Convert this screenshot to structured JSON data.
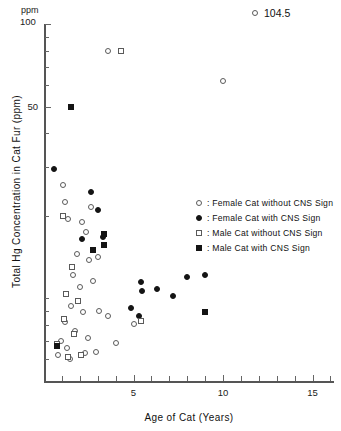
{
  "chart_data": {
    "type": "scatter",
    "title": "",
    "xlabel": "Age of Cat  (Years)",
    "ylabel": "Total Hg Concentration in Cat Fur  (ppm)",
    "yunit": "ppm",
    "yscale": "log",
    "xscale": "linear",
    "xlim": [
      0,
      16.2
    ],
    "ylim": [
      5,
      100
    ],
    "xticks": [
      5,
      10,
      15
    ],
    "xticklabels": [
      "5",
      "10",
      "15"
    ],
    "xminorticks": [
      1,
      2,
      3,
      4,
      6,
      7,
      8,
      9,
      11,
      12,
      13,
      14,
      16
    ],
    "yticks": [
      50,
      100
    ],
    "yticklabels": [
      "50",
      "100"
    ],
    "yminorticks": [
      6,
      7,
      8,
      9,
      10,
      20,
      30,
      40,
      60,
      70,
      80,
      90
    ],
    "grid": false,
    "legend_position": "center-right",
    "annotation": {
      "marker": "open-circle",
      "value": "104.5"
    },
    "series": [
      {
        "name": "Female Cat without CNS Sign",
        "marker": "open-circle",
        "points": [
          [
            3.6,
            80.0
          ],
          [
            10.0,
            62.0
          ],
          [
            1.05,
            26.0
          ],
          [
            1.2,
            22.5
          ],
          [
            1.35,
            19.5
          ],
          [
            2.1,
            19.0
          ],
          [
            2.35,
            17.5
          ],
          [
            2.6,
            21.5
          ],
          [
            1.85,
            14.5
          ],
          [
            2.5,
            13.8
          ],
          [
            3.0,
            14.2
          ],
          [
            1.6,
            12.2
          ],
          [
            2.0,
            11.0
          ],
          [
            2.75,
            11.6
          ],
          [
            1.5,
            9.4
          ],
          [
            2.2,
            8.9
          ],
          [
            3.1,
            9.0
          ],
          [
            1.15,
            8.2
          ],
          [
            1.75,
            7.6
          ],
          [
            2.45,
            7.2
          ],
          [
            0.95,
            7.0
          ],
          [
            3.55,
            8.6
          ],
          [
            5.0,
            8.1
          ],
          [
            1.3,
            6.6
          ],
          [
            2.9,
            6.4
          ],
          [
            4.0,
            6.9
          ],
          [
            0.8,
            6.2
          ],
          [
            1.45,
            6.0
          ],
          [
            2.3,
            6.3
          ]
        ]
      },
      {
        "name": "Female Cat with CNS Sign",
        "marker": "filled-circle",
        "points": [
          [
            0.55,
            29.5
          ],
          [
            2.6,
            24.5
          ],
          [
            3.0,
            21.0
          ],
          [
            2.15,
            16.5
          ],
          [
            3.3,
            16.8
          ],
          [
            5.4,
            11.5
          ],
          [
            5.5,
            10.6
          ],
          [
            6.3,
            10.8
          ],
          [
            7.2,
            10.2
          ],
          [
            8.0,
            12.0
          ],
          [
            9.0,
            12.2
          ],
          [
            5.3,
            8.6
          ],
          [
            4.85,
            9.2
          ]
        ]
      },
      {
        "name": "Male Cat without CNS Sign",
        "marker": "open-square",
        "points": [
          [
            4.3,
            80.0
          ],
          [
            1.05,
            20.0
          ],
          [
            1.55,
            13.0
          ],
          [
            1.25,
            10.4
          ],
          [
            1.9,
            9.8
          ],
          [
            1.1,
            8.4
          ],
          [
            1.65,
            7.4
          ],
          [
            0.75,
            6.8
          ],
          [
            1.35,
            6.1
          ],
          [
            2.05,
            6.2
          ],
          [
            5.4,
            8.3
          ]
        ]
      },
      {
        "name": "Male Cat with CNS Sign",
        "marker": "filled-square",
        "points": [
          [
            1.5,
            50.0
          ],
          [
            3.35,
            17.2
          ],
          [
            3.35,
            15.6
          ],
          [
            2.75,
            15.0
          ],
          [
            9.0,
            8.9
          ],
          [
            0.7,
            6.7
          ]
        ]
      }
    ]
  },
  "legend": {
    "items": [
      {
        "marker": "open-circle",
        "label": ": Female Cat without CNS Sign"
      },
      {
        "marker": "filled-circle",
        "label": ": Female Cat with CNS Sign"
      },
      {
        "marker": "open-square",
        "label": ": Male Cat without CNS Sign"
      },
      {
        "marker": "filled-square",
        "label": ": Male Cat with CNS Sign"
      }
    ]
  }
}
